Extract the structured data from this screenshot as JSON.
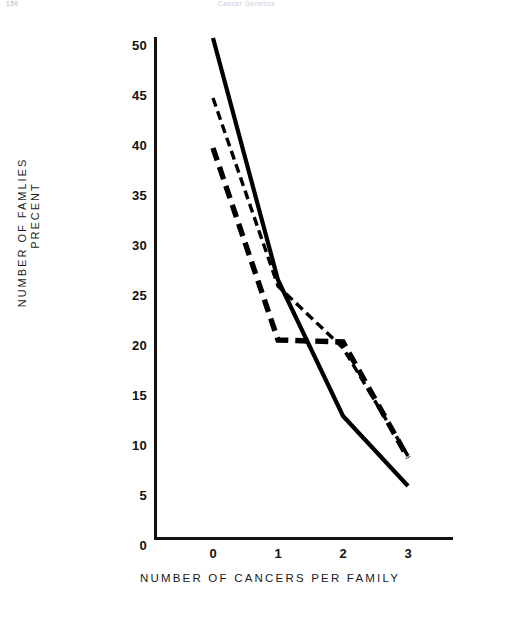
{
  "page": {
    "folio": "150",
    "running_head": "Cancer Genetics"
  },
  "axes": {
    "y_title_line1": "NUMBER OF FAMLIES",
    "y_title_line2": "PRECENT",
    "x_title": "NUMBER OF CANCERS PER FAMILY",
    "y_ticks": [
      "0",
      "5",
      "10",
      "15",
      "20",
      "25",
      "30",
      "35",
      "40",
      "45",
      "50"
    ],
    "x_ticks": [
      "0",
      "1",
      "2",
      "3"
    ]
  },
  "chart_data": {
    "type": "line",
    "title": "",
    "subtitle": "",
    "xlabel": "NUMBER OF CANCERS PER FAMILY",
    "ylabel": "NUMBER OF FAMLIES PRECENT",
    "x": [
      0,
      1,
      2,
      3
    ],
    "xlim": [
      -0.22,
      3.7
    ],
    "ylim": [
      0,
      50
    ],
    "xticks": [
      0,
      1,
      2,
      3
    ],
    "yticks": [
      0,
      5,
      10,
      15,
      20,
      25,
      30,
      35,
      40,
      45,
      50
    ],
    "grid": false,
    "legend_position": "none",
    "series": [
      {
        "name": "solid-curve",
        "style": "solid",
        "color": "#000000",
        "line_width": 4.2,
        "values": [
          50.0,
          25.8,
          12.2,
          5.2
        ]
      },
      {
        "name": "thin-dashed-curve",
        "style": "dashed-thin",
        "color": "#000000",
        "line_width": 3.4,
        "values": [
          44.0,
          25.2,
          19.0,
          8.2
        ]
      },
      {
        "name": "bold-dashed-curve",
        "style": "dashed-bold",
        "color": "#000000",
        "line_width": 5.4,
        "values": [
          39.0,
          19.8,
          19.6,
          8.0
        ]
      }
    ],
    "annotations": []
  },
  "geometry": {
    "x0_px": 213,
    "x_step_px": 65,
    "y0_px": 538,
    "y_unit_px": 10
  }
}
